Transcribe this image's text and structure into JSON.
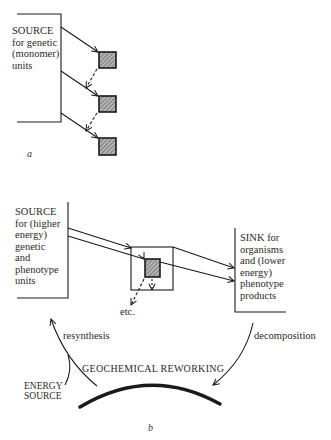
{
  "diagram_a": {
    "caption": "a",
    "source_label": "SOURCE\nfor genetic\n(monomer)\nunits",
    "units": 3
  },
  "diagram_b": {
    "caption": "b",
    "source_label": "SOURCE\nfor (higher\nenergy)\ngenetic\nand\nphenotype\nunits",
    "sink_label": "SINK for\norganisms\nand (lower\nenergy)\nphenotype\nproducts",
    "etc_label": "etc.",
    "resynthesis_label": "resynthesis",
    "decomposition_label": "decomposition",
    "reworking_label": "GEOCHEMICAL REWORKING",
    "energy_label": "ENERGY\nSOURCE"
  },
  "colors": {
    "ink": "#1a1a1a",
    "hatch": "#9a9a9a"
  }
}
